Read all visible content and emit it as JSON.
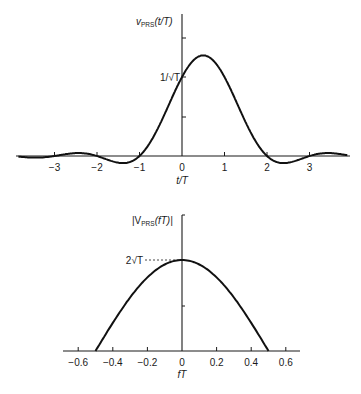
{
  "chart_data": [
    {
      "type": "line",
      "title": "",
      "ylabel": "v_PRS(t/T)",
      "ylabel_main": "v",
      "ylabel_sub": "PRS",
      "ylabel_arg": "(t/T)",
      "xlabel": "t/T",
      "x_ticks": [
        "−3",
        "−2",
        "−1",
        "0",
        "1",
        "2",
        "3"
      ],
      "x_tick_values": [
        -3,
        -2,
        -1,
        0,
        1,
        2,
        3
      ],
      "y_tick_label": "1/√T",
      "y_tick_label_value": 1.0,
      "xlim": [
        -3.8,
        3.9
      ],
      "ylim": [
        0,
        1.8
      ],
      "grid": false,
      "function": "sinc(t) + sinc(t-1)  (scaled by 1/√T)",
      "x": [
        -3.5,
        -3,
        -2.5,
        -2,
        -1.5,
        -1,
        -0.5,
        0,
        0.5,
        1,
        1.5,
        2,
        2.5,
        3,
        3.5
      ],
      "values": [
        0.026,
        0.0,
        0.047,
        0.0,
        -0.085,
        0.0,
        0.424,
        1.0,
        1.273,
        1.0,
        0.424,
        0.0,
        -0.085,
        0.0,
        0.047
      ]
    },
    {
      "type": "line",
      "title": "",
      "ylabel": "|V_PRS(fT)|",
      "ylabel_pre": "|V",
      "ylabel_sub": "PRS",
      "ylabel_arg": "(fT)|",
      "xlabel": "fT",
      "x_ticks": [
        "−0.6",
        "−0.4",
        "−0.2",
        "0",
        "0.2",
        "0.4",
        "0.6"
      ],
      "x_tick_values": [
        -0.6,
        -0.4,
        -0.2,
        0,
        0.2,
        0.4,
        0.6
      ],
      "y_tick_label": "2√T",
      "y_tick_label_value": 2.0,
      "xlim": [
        -0.7,
        0.7
      ],
      "ylim": [
        0,
        3.0
      ],
      "grid": false,
      "function": "2√T cos(π fT), |fT| ≤ 0.5",
      "x": [
        -0.5,
        -0.4,
        -0.3,
        -0.2,
        -0.1,
        0,
        0.1,
        0.2,
        0.3,
        0.4,
        0.5
      ],
      "values": [
        0.0,
        0.618,
        1.176,
        1.618,
        1.902,
        2.0,
        1.902,
        1.618,
        1.176,
        0.618,
        0.0
      ]
    }
  ]
}
